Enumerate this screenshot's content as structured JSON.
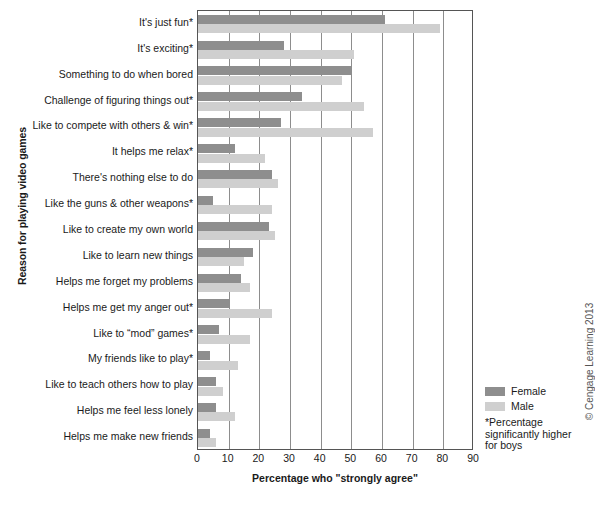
{
  "chart_data": {
    "type": "bar",
    "orientation": "horizontal",
    "title": "",
    "xlabel": "Percentage who \"strongly agree\"",
    "ylabel": "Reason for playing video games",
    "xlim": [
      0,
      90
    ],
    "xticks": [
      0,
      10,
      20,
      30,
      40,
      50,
      60,
      70,
      80,
      90
    ],
    "grid": "vertical",
    "legend_position": "right",
    "categories": [
      "It's just fun*",
      "It's exciting*",
      "Something to do when bored",
      "Challenge of figuring things out*",
      "Like to compete with others & win*",
      "It helps me relax*",
      "There's nothing else to do",
      "Like the guns & other weapons*",
      "Like to create my own world",
      "Like to learn new things",
      "Helps me forget my problems",
      "Helps me get my anger out*",
      "Like to “mod” games*",
      "My friends like to play*",
      "Like to teach others how to play",
      "Helps me feel less lonely",
      "Helps me make new friends"
    ],
    "series": [
      {
        "name": "Female",
        "color": "#8e8e8e",
        "values": [
          61,
          28,
          50,
          34,
          27,
          12,
          24,
          5,
          23,
          18,
          14,
          10,
          7,
          4,
          6,
          6,
          4
        ]
      },
      {
        "name": "Male",
        "color": "#cfcfcf",
        "values": [
          79,
          51,
          47,
          54,
          57,
          22,
          26,
          24,
          25,
          15,
          17,
          24,
          17,
          13,
          8,
          12,
          6
        ]
      }
    ],
    "annotations": [
      "*Percentage significantly higher for boys"
    ]
  },
  "legend": {
    "items": [
      {
        "label": "Female",
        "swatch": "female"
      },
      {
        "label": "Male",
        "swatch": "male"
      }
    ],
    "footnote_line1": "*Percentage",
    "footnote_line2": "significantly higher",
    "footnote_line3": "for boys"
  },
  "credit": "© Cengage Learning 2013"
}
